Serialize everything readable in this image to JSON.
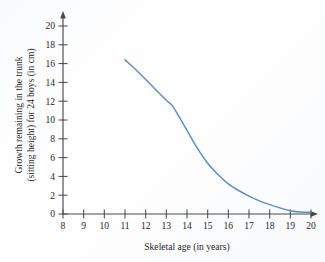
{
  "figure": {
    "name": "growth-remaining-in-trunk-chart",
    "background_color": "#fbfcfd"
  },
  "chart_data": {
    "type": "line",
    "title": "",
    "subtitle": "",
    "xlabel": "Skeletal age (in years)",
    "ylabel_line1": "Growth remaining in the trunk",
    "ylabel_line2": "(sitting height) for 24 boys (in cm)",
    "xlim": [
      8,
      20
    ],
    "ylim": [
      0,
      20
    ],
    "xticks": [
      8,
      9,
      10,
      11,
      12,
      13,
      14,
      15,
      16,
      17,
      18,
      19,
      20
    ],
    "yticks": [
      0,
      2,
      4,
      6,
      8,
      10,
      12,
      14,
      16,
      18,
      20
    ],
    "xtick_labels": [
      "8",
      "9",
      "10",
      "11",
      "12",
      "13",
      "14",
      "15",
      "16",
      "17",
      "18",
      "19",
      "20"
    ],
    "ytick_labels": [
      "0",
      "2",
      "4",
      "6",
      "8",
      "10",
      "12",
      "14",
      "16",
      "18",
      "20"
    ],
    "grid": false,
    "legend": null,
    "legend_position": "none",
    "series": [
      {
        "name": "Growth remaining in the trunk",
        "color": "#5b8fc0",
        "line_width": 1.5,
        "x": [
          11.0,
          11.5,
          12.0,
          12.5,
          13.0,
          13.3,
          13.6,
          14.0,
          14.5,
          15.0,
          15.5,
          16.0,
          16.5,
          17.0,
          17.5,
          18.0,
          18.5,
          19.0,
          19.5,
          20.0
        ],
        "y": [
          16.4,
          15.4,
          14.3,
          13.2,
          12.1,
          11.5,
          10.4,
          8.9,
          7.0,
          5.4,
          4.2,
          3.2,
          2.5,
          1.9,
          1.4,
          1.0,
          0.65,
          0.35,
          0.2,
          0.2
        ]
      }
    ],
    "annotations": []
  }
}
